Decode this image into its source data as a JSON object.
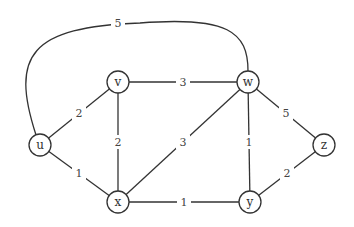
{
  "graph": {
    "type": "weighted-undirected",
    "nodes": [
      {
        "id": "u",
        "label": "u",
        "x": 40,
        "y": 145
      },
      {
        "id": "v",
        "label": "v",
        "x": 118,
        "y": 82
      },
      {
        "id": "w",
        "label": "w",
        "x": 248,
        "y": 82
      },
      {
        "id": "x",
        "label": "x",
        "x": 118,
        "y": 202
      },
      {
        "id": "y",
        "label": "y",
        "x": 250,
        "y": 202
      },
      {
        "id": "z",
        "label": "z",
        "x": 324,
        "y": 145
      }
    ],
    "edges": [
      {
        "from": "u",
        "to": "w",
        "weight": "5",
        "curved": true
      },
      {
        "from": "u",
        "to": "v",
        "weight": "2"
      },
      {
        "from": "u",
        "to": "x",
        "weight": "1"
      },
      {
        "from": "v",
        "to": "w",
        "weight": "3"
      },
      {
        "from": "v",
        "to": "x",
        "weight": "2"
      },
      {
        "from": "w",
        "to": "x",
        "weight": "3"
      },
      {
        "from": "w",
        "to": "y",
        "weight": "1"
      },
      {
        "from": "w",
        "to": "z",
        "weight": "5"
      },
      {
        "from": "x",
        "to": "y",
        "weight": "1"
      },
      {
        "from": "y",
        "to": "z",
        "weight": "2"
      }
    ]
  }
}
